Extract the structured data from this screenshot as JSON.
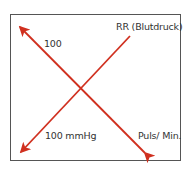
{
  "diagram": {
    "type": "crossing-arrows",
    "labels": {
      "top_left": "100",
      "top_right": "RR (Blutdruck)",
      "bottom_left": "100 mmHg",
      "bottom_right": "Puls/ Min."
    },
    "colors": {
      "arrow": "#d0301f",
      "frame": "#555555",
      "text": "#333333"
    }
  }
}
